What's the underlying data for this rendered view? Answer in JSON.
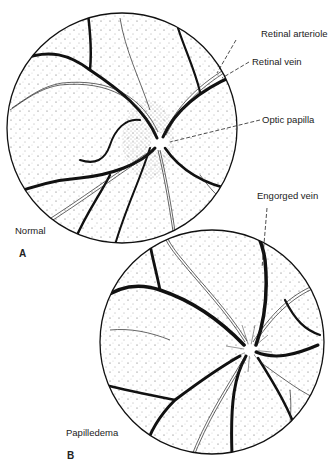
{
  "figure": {
    "panel_a": {
      "letter": "A",
      "caption": "Normal",
      "labels": {
        "retinal_arteriole": "Retinal arteriole",
        "retinal_vein": "Retinal vein",
        "optic_papilla": "Optic papilla"
      }
    },
    "panel_b": {
      "letter": "B",
      "caption": "Papilledema",
      "labels": {
        "engorged_vein": "Engorged vein"
      }
    },
    "colors": {
      "ink": "#111111",
      "background": "#ffffff"
    }
  }
}
